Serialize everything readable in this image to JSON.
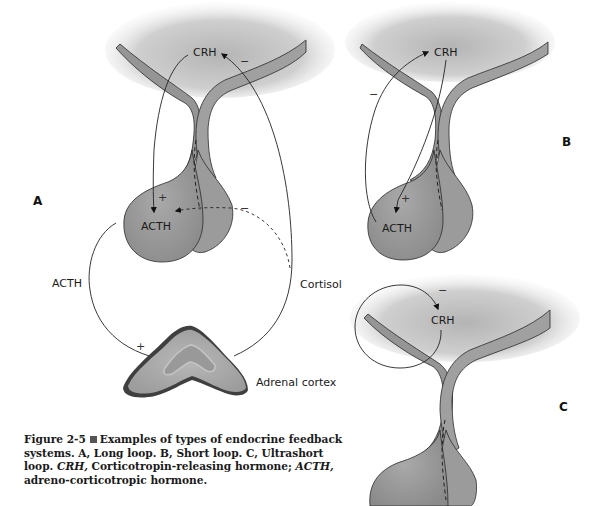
{
  "panels": {
    "A": {
      "letter": "A",
      "title": "Long loop",
      "labels": {
        "hypothalamus_hormone": "CRH",
        "pituitary_hormone": "ACTH",
        "circulating_acth": "ACTH",
        "cortisol": "Cortisol",
        "target_organ": "Adrenal cortex"
      },
      "signs": {
        "crh_to_acth": "+",
        "cortisol_to_crh": "−",
        "cortisol_to_acth": "−",
        "acth_to_adrenal": "+"
      }
    },
    "B": {
      "letter": "B",
      "title": "Short loop",
      "labels": {
        "hypothalamus_hormone": "CRH",
        "pituitary_hormone": "ACTH"
      },
      "signs": {
        "crh_to_acth": "+",
        "acth_to_crh": "−"
      }
    },
    "C": {
      "letter": "C",
      "title": "Ultrashort loop",
      "labels": {
        "hypothalamus_hormone": "CRH"
      },
      "signs": {
        "crh_to_crh": "−"
      }
    }
  },
  "caption": {
    "figure_number": "Figure 2-5",
    "text_1": "Examples of types of endocrine feedback systems.  A, Long loop. B, Short loop. C, Ultrashort loop. ",
    "abbr_1": "CRH,",
    "text_2": " Corticotropin-releasing hormone; ",
    "abbr_2": "ACTH,",
    "text_3": " adreno-corticotropic hormone."
  },
  "colors": {
    "tissue_dark": "#7a7a7a",
    "tissue_mid": "#a8a8a8",
    "tissue_light": "#e6e6e6",
    "outline": "#2a2a2a",
    "adrenal_edge": "#3a3a3a"
  }
}
